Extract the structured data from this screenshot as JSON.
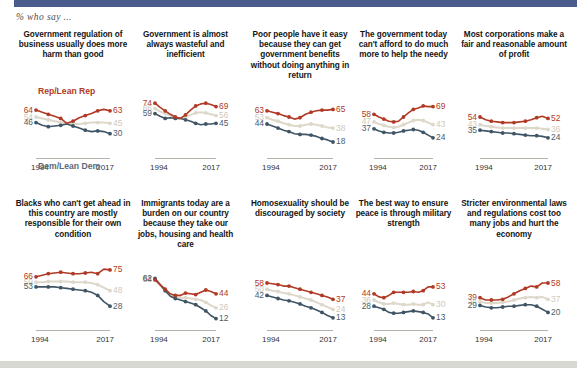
{
  "header": {
    "subtitle": "% who say ...",
    "strip_color": "#4a5c8c"
  },
  "legend": {
    "rep_label": "Rep/Lean Rep",
    "dem_label": "Dem/Lean Dem",
    "rep_color": "#b03a25",
    "dem_color": "#3f5565",
    "total_color": "#ddd8ca"
  },
  "axis": {
    "start_year": "1994",
    "end_year": "2017"
  },
  "chart_data": {
    "type": "line",
    "title": "% who say ...",
    "xlabel": "",
    "ylabel": "",
    "ylim": [
      0,
      80
    ],
    "x": [
      "1994",
      "1997",
      "1999",
      "2002",
      "2003",
      "2007",
      "2009",
      "2011",
      "2012",
      "2014",
      "2015",
      "2016",
      "2017"
    ],
    "grid": false,
    "legend_position": "inline-first-panel",
    "panels": [
      {
        "title": "Government regulation of business usually does more harm than good",
        "start_labels": {
          "rep": "64",
          "total": "54",
          "dem": "46"
        },
        "end_labels": {
          "rep": "63",
          "total": "45",
          "dem": "30"
        },
        "series": [
          {
            "name": "Rep/Lean Rep",
            "color": "#b03a25",
            "values": [
              64,
              61,
              58,
              55,
              52,
              45,
              48,
              53,
              56,
              59,
              63,
              65,
              63
            ]
          },
          {
            "name": "Total",
            "color": "#ddd8ca",
            "values": [
              54,
              52,
              50,
              48,
              46,
              45,
              44,
              44,
              45,
              46,
              46,
              46,
              45
            ]
          },
          {
            "name": "Dem/Lean Dem",
            "color": "#3f5565",
            "values": [
              46,
              42,
              40,
              41,
              42,
              44,
              41,
              38,
              35,
              33,
              34,
              33,
              30
            ]
          }
        ]
      },
      {
        "title": "Government is almost always wasteful and inefficient",
        "start_labels": {
          "rep": "74",
          "total": "66",
          "dem": "59"
        },
        "end_labels": {
          "rep": "69",
          "total": "56",
          "dem": "45"
        },
        "series": [
          {
            "name": "Rep/Lean Rep",
            "color": "#b03a25",
            "values": [
              74,
              68,
              63,
              58,
              54,
              52,
              57,
              64,
              70,
              73,
              74,
              72,
              69
            ]
          },
          {
            "name": "Total",
            "color": "#ddd8ca",
            "values": [
              66,
              62,
              59,
              56,
              53,
              52,
              54,
              57,
              60,
              61,
              60,
              58,
              56
            ]
          },
          {
            "name": "Dem/Lean Dem",
            "color": "#3f5565",
            "values": [
              59,
              55,
              52,
              53,
              52,
              52,
              50,
              48,
              45,
              43,
              44,
              44,
              45
            ]
          }
        ]
      },
      {
        "title": "Poor people have it easy because they can get government benefits without doing anything in return",
        "start_labels": {
          "rep": "63",
          "total": "53",
          "dem": "44"
        },
        "end_labels": {
          "rep": "65",
          "total": "38",
          "dem": "18"
        },
        "series": [
          {
            "name": "Rep/Lean Rep",
            "color": "#b03a25",
            "values": [
              63,
              61,
              59,
              56,
              54,
              51,
              53,
              58,
              61,
              63,
              64,
              64,
              65
            ]
          },
          {
            "name": "Total",
            "color": "#ddd8ca",
            "values": [
              53,
              50,
              48,
              45,
              43,
              41,
              41,
              43,
              44,
              43,
              41,
              39,
              38
            ]
          },
          {
            "name": "Dem/Lean Dem",
            "color": "#3f5565",
            "values": [
              44,
              41,
              38,
              35,
              33,
              30,
              29,
              29,
              28,
              26,
              23,
              21,
              18
            ]
          }
        ]
      },
      {
        "title": "The government today can't afford to do much more to help the needy",
        "start_labels": {
          "rep": "58",
          "total": "47",
          "dem": "37"
        },
        "end_labels": {
          "rep": "69",
          "total": "43",
          "dem": "24"
        },
        "series": [
          {
            "name": "Rep/Lean Rep",
            "color": "#b03a25",
            "values": [
              58,
              54,
              51,
              48,
              47,
              48,
              54,
              60,
              65,
              67,
              70,
              69,
              69
            ]
          },
          {
            "name": "Total",
            "color": "#ddd8ca",
            "values": [
              47,
              44,
              42,
              40,
              39,
              40,
              43,
              46,
              49,
              50,
              49,
              46,
              43
            ]
          },
          {
            "name": "Dem/Lean Dem",
            "color": "#3f5565",
            "values": [
              37,
              34,
              32,
              31,
              31,
              32,
              34,
              35,
              36,
              35,
              32,
              28,
              24
            ]
          }
        ]
      },
      {
        "title": "Most corporations make a fair and reasonable amount of profit",
        "start_labels": {
          "rep": "54",
          "total": "43",
          "dem": "35"
        },
        "end_labels": {
          "rep": "52",
          "total": "36",
          "dem": "24"
        },
        "series": [
          {
            "name": "Rep/Lean Rep",
            "color": "#b03a25",
            "values": [
              54,
              50,
              48,
              47,
              46,
              46,
              46,
              47,
              48,
              50,
              53,
              55,
              52
            ]
          },
          {
            "name": "Total",
            "color": "#ddd8ca",
            "values": [
              43,
              41,
              40,
              39,
              38,
              38,
              38,
              38,
              38,
              38,
              38,
              37,
              36
            ]
          },
          {
            "name": "Dem/Lean Dem",
            "color": "#3f5565",
            "values": [
              35,
              34,
              33,
              32,
              31,
              31,
              30,
              29,
              28,
              27,
              27,
              26,
              24
            ]
          }
        ]
      },
      {
        "title": "Blacks who can't get ahead in this country are mostly responsible for their own condition",
        "start_labels": {
          "rep": "66",
          "total": "59",
          "dem": "53"
        },
        "end_labels": {
          "rep": "75",
          "total": "48",
          "dem": "28"
        },
        "series": [
          {
            "name": "Rep/Lean Rep",
            "color": "#b03a25",
            "values": [
              66,
              68,
              70,
              71,
              72,
              71,
              70,
              70,
              71,
              72,
              70,
              76,
              75
            ]
          },
          {
            "name": "Total",
            "color": "#ddd8ca",
            "values": [
              59,
              59,
              60,
              60,
              60,
              60,
              59,
              59,
              59,
              58,
              56,
              52,
              48
            ]
          },
          {
            "name": "Dem/Lean Dem",
            "color": "#3f5565",
            "values": [
              53,
              53,
              53,
              53,
              52,
              51,
              50,
              49,
              48,
              46,
              42,
              34,
              28
            ]
          }
        ]
      },
      {
        "title": "Immigrants today are a burden on our country because they take our jobs, housing and health care",
        "start_labels": {
          "rep": "64",
          "total": "63",
          "dem": "62"
        },
        "end_labels": {
          "rep": "44",
          "total": "26",
          "dem": "12"
        },
        "series": [
          {
            "name": "Rep/Lean Rep",
            "color": "#b03a25",
            "values": [
              62,
              56,
              50,
              44,
              42,
              42,
              45,
              44,
              43,
              46,
              49,
              47,
              44
            ]
          },
          {
            "name": "Total",
            "color": "#ddd8ca",
            "values": [
              63,
              55,
              48,
              42,
              40,
              39,
              39,
              38,
              37,
              36,
              33,
              29,
              26
            ]
          },
          {
            "name": "Dem/Lean Dem",
            "color": "#3f5565",
            "values": [
              64,
              56,
              48,
              41,
              38,
              36,
              34,
              32,
              30,
              26,
              22,
              16,
              12
            ]
          }
        ]
      },
      {
        "title": "Homosexuality should be discouraged by society",
        "start_labels": {
          "rep": "58",
          "total": "50",
          "dem": "42"
        },
        "end_labels": {
          "rep": "37",
          "total": "24",
          "dem": "13"
        },
        "series": [
          {
            "name": "Rep/Lean Rep",
            "color": "#b03a25",
            "values": [
              58,
              57,
              56,
              54,
              54,
              52,
              50,
              48,
              46,
              44,
              42,
              40,
              37
            ]
          },
          {
            "name": "Total",
            "color": "#ddd8ca",
            "values": [
              50,
              48,
              47,
              45,
              44,
              42,
              40,
              38,
              36,
              33,
              30,
              27,
              24
            ]
          },
          {
            "name": "Dem/Lean Dem",
            "color": "#3f5565",
            "values": [
              42,
              40,
              38,
              36,
              35,
              33,
              31,
              28,
              26,
              23,
              20,
              16,
              13
            ]
          }
        ]
      },
      {
        "title": "The best way to ensure peace is through military strength",
        "start_labels": {
          "rep": "44",
          "total": "36",
          "dem": "28"
        },
        "end_labels": {
          "rep": "53",
          "total": "30",
          "dem": "13"
        },
        "series": [
          {
            "name": "Rep/Lean Rep",
            "color": "#b03a25",
            "values": [
              44,
              40,
              39,
              42,
              46,
              46,
              46,
              46,
              47,
              46,
              48,
              53,
              53
            ]
          },
          {
            "name": "Total",
            "color": "#ddd8ca",
            "values": [
              36,
              33,
              31,
              31,
              32,
              31,
              30,
              30,
              31,
              30,
              30,
              33,
              30
            ]
          },
          {
            "name": "Dem/Lean Dem",
            "color": "#3f5565",
            "values": [
              28,
              26,
              24,
              20,
              19,
              19,
              20,
              21,
              22,
              21,
              20,
              18,
              13
            ]
          }
        ]
      },
      {
        "title": "Stricter environmental laws and regulations cost too many jobs and hurt the economy",
        "start_labels": {
          "rep": "39",
          "total": "34",
          "dem": "29"
        },
        "end_labels": {
          "rep": "58",
          "total": "37",
          "dem": "20"
        },
        "series": [
          {
            "name": "Rep/Lean Rep",
            "color": "#b03a25",
            "values": [
              39,
              36,
              36,
              36,
              37,
              40,
              44,
              48,
              51,
              54,
              53,
              58,
              58
            ]
          },
          {
            "name": "Total",
            "color": "#ddd8ca",
            "values": [
              34,
              32,
              32,
              32,
              33,
              34,
              36,
              38,
              39,
              40,
              39,
              40,
              37
            ]
          },
          {
            "name": "Dem/Lean Dem",
            "color": "#3f5565",
            "values": [
              29,
              27,
              26,
              26,
              27,
              28,
              28,
              29,
              30,
              30,
              28,
              24,
              20
            ]
          }
        ]
      }
    ]
  }
}
